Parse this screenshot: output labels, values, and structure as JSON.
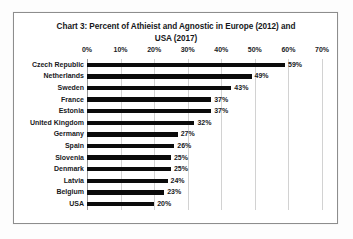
{
  "chart_data": {
    "type": "bar",
    "orientation": "horizontal",
    "title": "Chart 3: Percent of Athieist and Agnostic in Europe (2012) and USA (2017)",
    "title_lines": [
      "Chart 3: Percent of Athieist and Agnostic in Europe (2012) and",
      "USA (2017)"
    ],
    "xlabel": "",
    "ylabel": "",
    "categories": [
      "Czech Republic",
      "Netherlands",
      "Sweden",
      "France",
      "Estonia",
      "United Kingdom",
      "Germany",
      "Spain",
      "Slovenia",
      "Denmark",
      "Latvia",
      "Belgium",
      "USA"
    ],
    "values": [
      59,
      49,
      43,
      37,
      37,
      32,
      27,
      26,
      25,
      25,
      24,
      23,
      20
    ],
    "data_labels": [
      "59%",
      "49%",
      "43%",
      "37%",
      "37%",
      "32%",
      "27%",
      "26%",
      "25%",
      "25%",
      "24%",
      "23%",
      "20%"
    ],
    "xlim": [
      0,
      70
    ],
    "xticks": [
      0,
      10,
      20,
      30,
      40,
      50,
      60,
      70
    ],
    "xtick_labels": [
      "0%",
      "10%",
      "20%",
      "30%",
      "40%",
      "50%",
      "60%",
      "70%"
    ],
    "grid": "vertical",
    "legend": "none",
    "bar_color": "#0b0b0b",
    "gridline_color": "#d2d2d2",
    "plot_background": "#ffffff",
    "frame_border_color": "#8d8d8d"
  }
}
